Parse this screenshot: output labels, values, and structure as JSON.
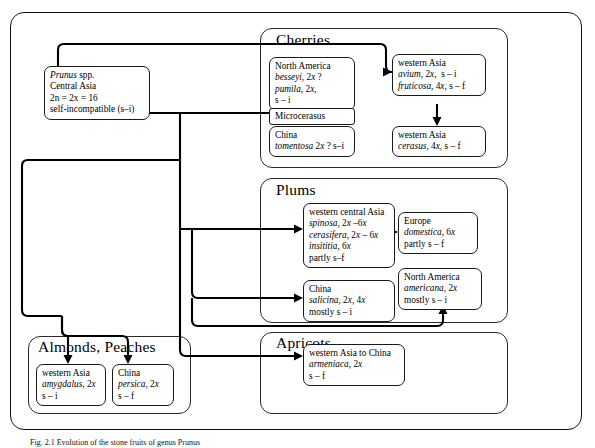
{
  "diagram": {
    "root": {
      "lines": [
        "Prunus spp.",
        "Central  Asia",
        "2n = 2x = 16",
        "self-incompatible (s–i)"
      ],
      "italic_first_word": "Prunus"
    },
    "groups": [
      {
        "key": "cherries",
        "title": "Cherries"
      },
      {
        "key": "plums",
        "title": "Plums"
      },
      {
        "key": "almonds_peaches",
        "title": "Almonds, Peaches"
      },
      {
        "key": "apricots",
        "title": "Apricots"
      }
    ],
    "nodes": {
      "north_america_cherry": {
        "lines": [
          "North America",
          "besseyi, 2x ?",
          "pumila, 2x,",
          "s – i"
        ]
      },
      "microcerasus": {
        "lines": [
          "Microcerasus"
        ]
      },
      "china_cherry": {
        "lines": [
          "China",
          "tomentosa 2x ? s–i"
        ]
      },
      "western_asia_avium": {
        "lines": [
          "western Asia",
          "avium, 2x,  s – i",
          "fruticosa, 4x, s – f"
        ]
      },
      "western_asia_cerasus": {
        "lines": [
          "western Asia",
          "cerasus, 4x, s – f"
        ]
      },
      "western_central_asia_plum": {
        "lines": [
          "western central Asia",
          "spinosa, 2x –6x",
          "cerasifera, 2x – 6x",
          "insititia, 6x",
          "partly s–f"
        ]
      },
      "europe_domestica": {
        "lines": [
          "Europe",
          "domestica, 6x",
          "partly s – f"
        ]
      },
      "china_salicina": {
        "lines": [
          "China",
          "salicina, 2x, 4x",
          "mostly s – i"
        ]
      },
      "north_america_americana": {
        "lines": [
          "North America",
          "americana, 2x",
          "mostly s – i"
        ]
      },
      "western_asia_amygdalus": {
        "lines": [
          "western  Asia",
          "amygdalus, 2x",
          "s – i"
        ]
      },
      "china_persica": {
        "lines": [
          "China",
          "persica, 2x",
          "s – f"
        ]
      },
      "western_asia_to_china_armeniaca": {
        "lines": [
          "western  Asia  to China",
          "armeniaca, 2x",
          "s – f"
        ]
      }
    },
    "caption": "Fig. 2.1  Evolution of the stone fruits of genus Prunus"
  }
}
